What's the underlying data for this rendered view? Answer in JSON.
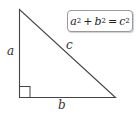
{
  "diagram": {
    "labels": {
      "side_a": "a",
      "side_b": "b",
      "hypotenuse": "c"
    },
    "formula": {
      "a": "a",
      "b": "b",
      "c": "c",
      "exp": "2",
      "plus": "+",
      "equals": "="
    },
    "colors": {
      "stroke": "#444444",
      "box_border": "#9a9a9a"
    }
  }
}
